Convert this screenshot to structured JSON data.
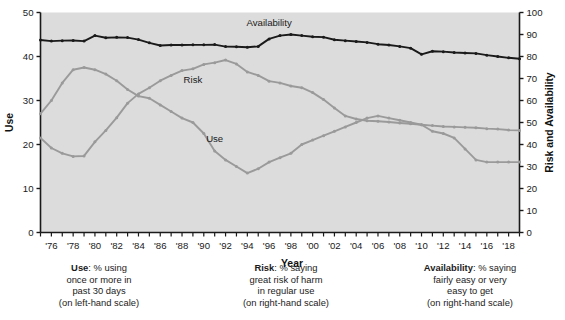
{
  "chart_data": {
    "type": "line",
    "title": "",
    "xlabel": "Year",
    "ylabel": "Use",
    "y2label": "Risk and Availability",
    "ylim": [
      0,
      50
    ],
    "y2lim": [
      0,
      100
    ],
    "grid": false,
    "legend_position": "inline-annotations",
    "x": [
      1975,
      1976,
      1977,
      1978,
      1979,
      1980,
      1981,
      1982,
      1983,
      1984,
      1985,
      1986,
      1987,
      1988,
      1989,
      1990,
      1991,
      1992,
      1993,
      1994,
      1995,
      1996,
      1997,
      1998,
      1999,
      2000,
      2001,
      2002,
      2003,
      2004,
      2005,
      2006,
      2007,
      2008,
      2009,
      2010,
      2011,
      2012,
      2013,
      2014,
      2015,
      2016,
      2017,
      2018,
      2019
    ],
    "xtick_labels": [
      "'76",
      "'78",
      "'80",
      "'82",
      "'84",
      "'86",
      "'88",
      "'90",
      "'92",
      "'94",
      "'96",
      "'98",
      "'00",
      "'02",
      "'04",
      "'06",
      "'08",
      "'10",
      "'12",
      "'14",
      "'16",
      "'18"
    ],
    "xtick_values": [
      1976,
      1978,
      1980,
      1982,
      1984,
      1986,
      1988,
      1990,
      1992,
      1994,
      1996,
      1998,
      2000,
      2002,
      2004,
      2006,
      2008,
      2010,
      2012,
      2014,
      2016,
      2018
    ],
    "ytick_labels": [
      "0",
      "10",
      "20",
      "30",
      "40",
      "50"
    ],
    "ytick_values": [
      0,
      10,
      20,
      30,
      40,
      50
    ],
    "y2tick_labels": [
      "0",
      "10",
      "20",
      "30",
      "40",
      "50",
      "60",
      "70",
      "80",
      "90",
      "100"
    ],
    "y2tick_values": [
      0,
      10,
      20,
      30,
      40,
      50,
      60,
      70,
      80,
      90,
      100
    ],
    "series": [
      {
        "name": "Use",
        "axis": "left",
        "color": "#9a9a9a",
        "label_x": 1991,
        "label_y": 20.5,
        "values": [
          21.5,
          19.2,
          18.0,
          17.3,
          17.4,
          20.6,
          23.2,
          26.1,
          29.4,
          31.5,
          32.9,
          34.5,
          35.7,
          36.8,
          37.2,
          38.2,
          38.6,
          39.2,
          38.3,
          36.5,
          35.7,
          34.4,
          34.0,
          33.3,
          32.9,
          31.8,
          30.2,
          28.3,
          26.5,
          25.8,
          25.4,
          25.3,
          25.1,
          24.9,
          24.7,
          24.5,
          24.3,
          24.1,
          24.0,
          23.9,
          23.8,
          23.6,
          23.5,
          23.3,
          23.2
        ]
      },
      {
        "name": "Risk",
        "axis": "right",
        "color": "#9a9a9a",
        "label_x": 1989,
        "label_y": 68,
        "values": [
          54,
          60,
          68,
          74,
          75,
          74,
          72,
          69,
          65,
          62,
          61,
          58,
          55,
          52,
          50,
          45,
          37,
          33,
          30,
          27,
          29,
          32,
          34,
          36,
          40,
          42,
          44,
          46,
          48,
          50,
          52,
          53,
          52,
          51,
          50,
          49,
          46,
          45,
          43,
          38,
          33,
          32,
          32,
          32,
          32
        ]
      },
      {
        "name": "Availability",
        "axis": "right",
        "color": "#1a1a1a",
        "label_x": 1996,
        "label_y": 94,
        "values": [
          87.5,
          87.0,
          87.2,
          87.3,
          87.0,
          89.5,
          88.5,
          88.7,
          88.6,
          87.7,
          86.2,
          85.0,
          85.2,
          85.2,
          85.3,
          85.3,
          85.4,
          84.5,
          84.4,
          84.2,
          84.6,
          88.0,
          89.5,
          90.0,
          89.5,
          89.0,
          88.8,
          87.6,
          87.2,
          86.8,
          86.4,
          85.6,
          85.2,
          84.6,
          83.8,
          81.0,
          82.4,
          82.2,
          81.8,
          81.6,
          81.4,
          80.6,
          80.0,
          79.4,
          79.0
        ]
      }
    ]
  },
  "captions": {
    "use": {
      "bold": "Use",
      "rest": ": % using",
      "l2": "once or more in",
      "l3": "past 30 days",
      "l4": "(on left-hand scale)"
    },
    "risk": {
      "bold": "Risk",
      "rest": ": % saying",
      "l2": "great risk of harm",
      "l3": "in regular use",
      "l4": "(on right-hand scale)"
    },
    "availability": {
      "bold": "Availability",
      "rest": ": % saying",
      "l2": "fairly easy or very",
      "l3": "easy to get",
      "l4": "(on right-hand scale)"
    }
  },
  "colors": {
    "plot_background": "#dcdcdc",
    "axis": "#1a1a1a",
    "grey_series": "#9a9a9a",
    "dark_series": "#1a1a1a",
    "page_background": "#ffffff"
  }
}
